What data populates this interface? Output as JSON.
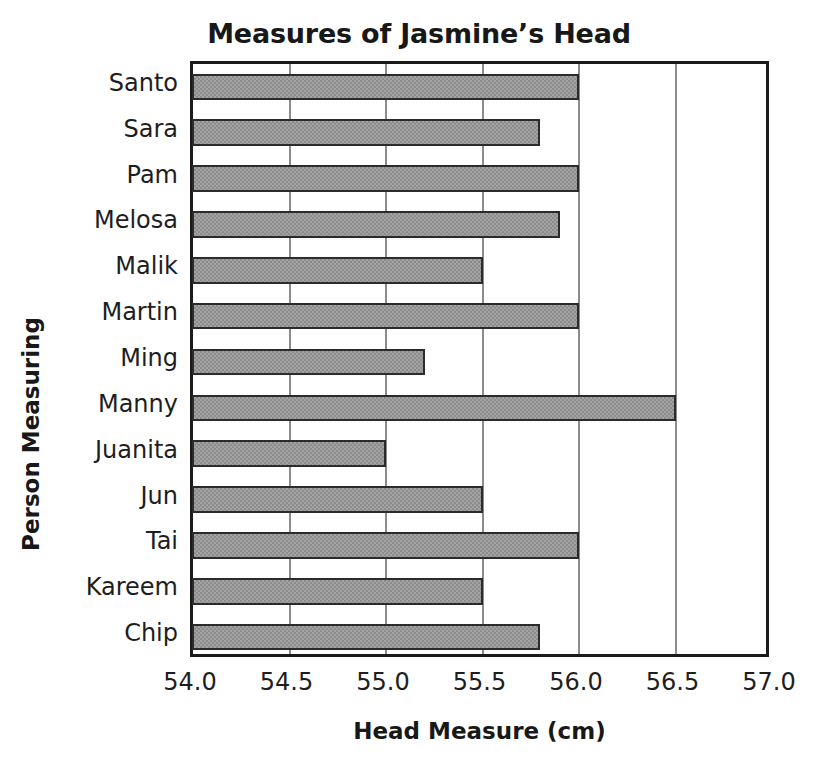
{
  "chart_data": {
    "type": "bar",
    "orientation": "horizontal",
    "title": "Measures of Jasmine’s Head",
    "xlabel": "Head Measure (cm)",
    "ylabel": "Person Measuring",
    "xlim": [
      54.0,
      57.0
    ],
    "xticks": [
      "54.0",
      "54.5",
      "55.0",
      "55.5",
      "56.0",
      "56.5",
      "57.0"
    ],
    "xtick_values": [
      54.0,
      54.5,
      55.0,
      55.5,
      56.0,
      56.5,
      57.0
    ],
    "grid": "vertical",
    "legend": "none",
    "categories": [
      "Santo",
      "Sara",
      "Pam",
      "Melosa",
      "Malik",
      "Martin",
      "Ming",
      "Manny",
      "Juanita",
      "Jun",
      "Tai",
      "Kareem",
      "Chip"
    ],
    "values": [
      56.0,
      55.8,
      56.0,
      55.9,
      55.5,
      56.0,
      55.2,
      56.5,
      55.0,
      55.5,
      56.0,
      55.5,
      55.8
    ],
    "bar_color": "#a3a3a3",
    "bar_edge_color": "#2b2b2b",
    "gridline_color": "#8c8c8c",
    "axis_color": "#1b1b1b"
  }
}
